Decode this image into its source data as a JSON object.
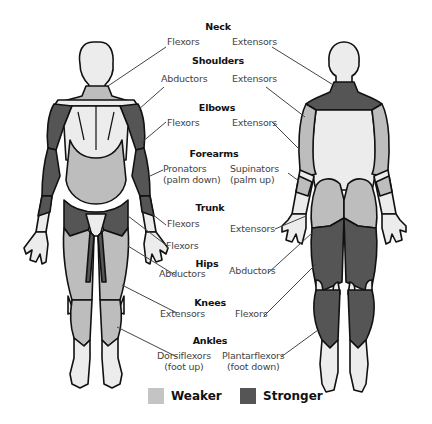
{
  "diagram": {
    "colors": {
      "weaker": "#bdbdbd",
      "stronger": "#555555",
      "skin": "#ececec",
      "outline": "#111111",
      "leader": "#444444"
    },
    "groups": [
      {
        "heading": "Neck",
        "front": "Flexors",
        "back": "Extensors"
      },
      {
        "heading": "Shoulders",
        "front": "Abductors",
        "back": "Extensors"
      },
      {
        "heading": "Elbows",
        "front": "Flexors",
        "back": "Extensors"
      },
      {
        "heading": "Forearms",
        "front": "Pronators\n(palm down)",
        "front_lines": [
          "Pronators",
          "(palm down)"
        ],
        "back_lines": [
          "Supinators",
          "(palm up)"
        ]
      },
      {
        "heading": "Trunk",
        "front": "Flexors",
        "front2": "Flexors",
        "back": "Extensors"
      },
      {
        "heading": "Hips",
        "front": "Abductors",
        "back": "Abductors"
      },
      {
        "heading": "Knees",
        "front": "Extensors",
        "back": "Flexors"
      },
      {
        "heading": "Ankles",
        "front_lines": [
          "Dorsiflexors",
          "(foot up)"
        ],
        "back_lines": [
          "Plantarflexors",
          "(foot down)"
        ]
      }
    ],
    "legend": [
      {
        "label": "Weaker",
        "color": "#bdbdbd"
      },
      {
        "label": "Stronger",
        "color": "#555555"
      }
    ]
  }
}
